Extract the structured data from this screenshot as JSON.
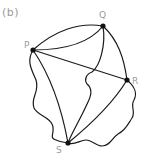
{
  "figure": {
    "panel_label": "(b)",
    "colors": {
      "edge": "#1a1a1a",
      "node": "#111111",
      "label": "#9a9a9a",
      "background": "#ffffff"
    },
    "nodes": [
      {
        "id": "P",
        "label": "P",
        "x": 33,
        "y": 50
      },
      {
        "id": "Q",
        "label": "Q",
        "x": 103,
        "y": 26
      },
      {
        "id": "R",
        "label": "R",
        "x": 127,
        "y": 80
      },
      {
        "id": "S",
        "label": "S",
        "x": 68,
        "y": 143
      }
    ],
    "edges": [
      {
        "from": "P",
        "to": "Q",
        "style": "arc-upper"
      },
      {
        "from": "P",
        "to": "Q",
        "style": "arc-lower"
      },
      {
        "from": "P",
        "to": "R",
        "style": "straight"
      },
      {
        "from": "P",
        "to": "S",
        "style": "curve"
      },
      {
        "from": "P",
        "to": "S",
        "style": "wavy-outer"
      },
      {
        "from": "Q",
        "to": "R",
        "style": "curve"
      },
      {
        "from": "Q",
        "to": "S",
        "style": "curve-with-kink"
      },
      {
        "from": "R",
        "to": "S",
        "style": "curve"
      },
      {
        "from": "R",
        "to": "S",
        "style": "wavy-outer"
      }
    ]
  }
}
